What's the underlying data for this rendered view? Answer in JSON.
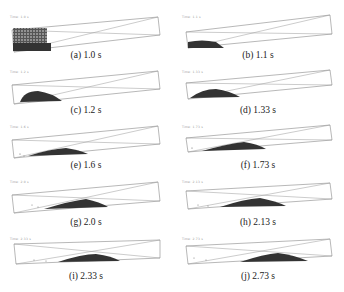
{
  "figure": {
    "panels": [
      {
        "label": "(a) 1.0 s",
        "time_s": 1.0,
        "tag": "Time: 1.0 s"
      },
      {
        "label": "(b) 1.1 s",
        "time_s": 1.1,
        "tag": "Time: 1.1 s"
      },
      {
        "label": "(c) 1.2 s",
        "time_s": 1.2,
        "tag": "Time: 1.2 s"
      },
      {
        "label": "(d) 1.33 s",
        "time_s": 1.33,
        "tag": "Time: 1.33 s"
      },
      {
        "label": "(e) 1.6 s",
        "time_s": 1.6,
        "tag": "Time: 1.6 s"
      },
      {
        "label": "(f) 1.73 s",
        "time_s": 1.73,
        "tag": "Time: 1.73 s"
      },
      {
        "label": "(g) 2.0 s",
        "time_s": 2.0,
        "tag": "Time: 2.0 s"
      },
      {
        "label": "(h) 2.13 s",
        "time_s": 2.13,
        "tag": "Time: 2.13 s"
      },
      {
        "label": "(i) 2.33 s",
        "time_s": 2.33,
        "tag": "Time: 2.33 s"
      },
      {
        "label": "(j) 2.73 s",
        "time_s": 2.73,
        "tag": "Time: 2.73 s"
      }
    ]
  }
}
